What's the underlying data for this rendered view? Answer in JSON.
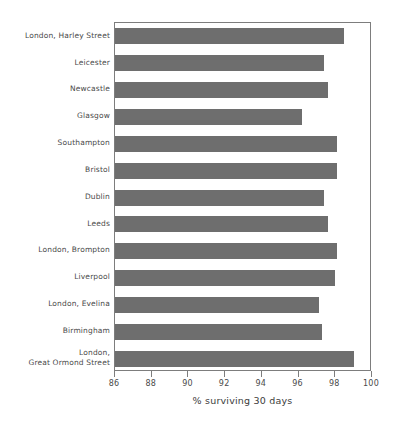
{
  "chart_data": {
    "type": "bar",
    "orientation": "horizontal",
    "title": "",
    "xlabel": "% surviving 30 days",
    "ylabel": "",
    "xlim": [
      86,
      100
    ],
    "xticks": [
      86,
      88,
      90,
      92,
      94,
      96,
      98,
      100
    ],
    "xtick_labels": [
      "86",
      "88",
      "90",
      "92",
      "94",
      "96",
      "98",
      "100"
    ],
    "grid": false,
    "legend": null,
    "bar_color": "#6e6e6e",
    "categories": [
      "London, Harley Street",
      "Leicester",
      "Newcastle",
      "Glasgow",
      "Southampton",
      "Bristol",
      "Dublin",
      "Leeds",
      "London, Brompton",
      "Liverpool",
      "London, Evelina",
      "Birmingham",
      "London,\nGreat Ormond Street"
    ],
    "values": [
      98.5,
      97.4,
      97.6,
      96.2,
      98.1,
      98.1,
      97.4,
      97.6,
      98.1,
      98.0,
      97.1,
      97.3,
      99.0
    ]
  }
}
